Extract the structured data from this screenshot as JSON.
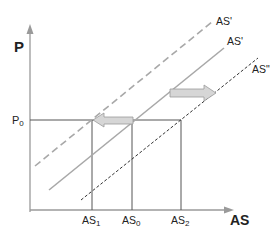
{
  "axes": {
    "y_label": "P",
    "x_label": "AS"
  },
  "price_level": {
    "label_main": "P",
    "label_sub": "0"
  },
  "x_ticks": [
    {
      "main": "AS",
      "sub": "1"
    },
    {
      "main": "AS",
      "sub": "0"
    },
    {
      "main": "AS",
      "sub": "2"
    }
  ],
  "curves": [
    {
      "label": "AS'",
      "style": "dashed",
      "color": "#a8a8a8"
    },
    {
      "label": "AS'",
      "style": "solid",
      "color": "#a8a8a8"
    },
    {
      "label": "AS\"",
      "style": "dotted",
      "color": "#333333"
    }
  ],
  "shifts": [
    {
      "direction": "left",
      "fill": "#d6d6d6",
      "stroke": "#9a9a9a"
    },
    {
      "direction": "right",
      "fill": "#d6d6d6",
      "stroke": "#9a9a9a"
    }
  ],
  "colors": {
    "axis": "#9a9a9a",
    "guide": "#555555"
  }
}
